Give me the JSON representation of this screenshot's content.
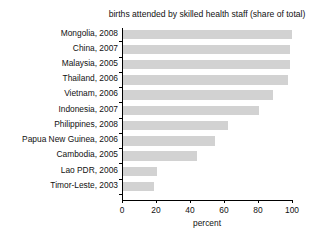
{
  "chart_data": {
    "type": "bar",
    "orientation": "horizontal",
    "title": "births attended by skilled health staff (share of total)",
    "xlabel": "percent",
    "ylabel": "",
    "xlim": [
      0,
      100
    ],
    "xticks": [
      0,
      20,
      40,
      60,
      80,
      100
    ],
    "grid": false,
    "legend": null,
    "bar_color": "#d2d2d2",
    "categories": [
      "Mongolia, 2008",
      "China, 2007",
      "Malaysia, 2005",
      "Thailand, 2006",
      "Vietnam, 2006",
      "Indonesia, 2007",
      "Philippines, 2008",
      "Papua New Guinea, 2006",
      "Cambodia, 2005",
      "Lao PDR, 2006",
      "Timor-Leste, 2003"
    ],
    "values": [
      99.5,
      98.5,
      98.5,
      97,
      88.5,
      80,
      62,
      54,
      43.5,
      20,
      18
    ]
  }
}
